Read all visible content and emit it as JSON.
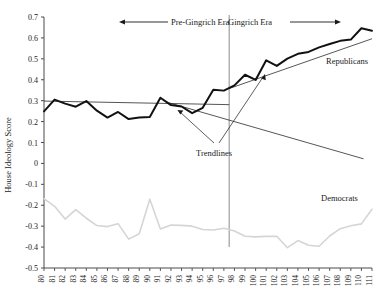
{
  "chart_data": {
    "type": "line",
    "title": "",
    "xlabel": "",
    "ylabel": "House Ideology Score",
    "xlim": [
      80,
      111
    ],
    "ylim": [
      -0.5,
      0.7
    ],
    "grid": false,
    "legend_position": "inline-labels",
    "categories": [
      80,
      81,
      82,
      83,
      84,
      85,
      86,
      87,
      88,
      89,
      90,
      91,
      92,
      93,
      94,
      95,
      96,
      97,
      98,
      99,
      100,
      101,
      102,
      103,
      104,
      105,
      106,
      107,
      108,
      109,
      110,
      111
    ],
    "xtick_labels": [
      "80",
      "81",
      "82",
      "83",
      "84",
      "85",
      "86",
      "87",
      "88",
      "89",
      "90",
      "91",
      "92",
      "93",
      "94",
      "95",
      "96",
      "97",
      "98",
      "99",
      "100",
      "101",
      "102",
      "103",
      "104",
      "105",
      "106",
      "107",
      "108",
      "109",
      "110",
      "111"
    ],
    "ytick_labels": [
      "0.7",
      "0.6",
      "0.5",
      "0.4",
      "0.3",
      "0.2",
      "0.1",
      "0",
      "-0.1",
      "-0.2",
      "-0.3",
      "-0.4",
      "-0.5"
    ],
    "ytick_values": [
      0.7,
      0.6,
      0.5,
      0.4,
      0.3,
      0.2,
      0.1,
      0,
      -0.1,
      -0.2,
      -0.3,
      -0.4,
      -0.5
    ],
    "series": [
      {
        "name": "Republicans",
        "color": "#111111",
        "values": [
          0.249,
          0.305,
          0.286,
          0.271,
          0.298,
          0.252,
          0.219,
          0.246,
          0.212,
          0.219,
          0.222,
          0.314,
          0.279,
          0.272,
          0.24,
          0.266,
          0.352,
          0.348,
          0.373,
          0.424,
          0.399,
          0.493,
          0.466,
          0.501,
          0.524,
          0.533,
          0.555,
          0.571,
          0.586,
          0.592,
          0.646,
          0.634
        ]
      },
      {
        "name": "Democrats",
        "color": "#d5d5d5",
        "values": [
          -0.168,
          -0.205,
          -0.266,
          -0.221,
          -0.262,
          -0.297,
          -0.302,
          -0.288,
          -0.362,
          -0.336,
          -0.171,
          -0.314,
          -0.295,
          -0.296,
          -0.3,
          -0.316,
          -0.318,
          -0.31,
          -0.323,
          -0.348,
          -0.351,
          -0.349,
          -0.348,
          -0.403,
          -0.369,
          -0.391,
          -0.396,
          -0.347,
          -0.312,
          -0.298,
          -0.289,
          -0.219
        ]
      }
    ],
    "annotations": {
      "era_divider": {
        "x": 97.5,
        "label": "era-divider",
        "color": "#8a8a8a"
      },
      "pre_era_label": "Pre-Gingrich Era",
      "post_era_label": "Gingrich Era",
      "trendlines_label": "Trendlines",
      "republicans_label": "Republicans",
      "democrats_label": "Democrats",
      "trendlines": [
        {
          "name": "pre-gingrich-trendline",
          "x0": 80,
          "y0": 0.298,
          "x1": 97.5,
          "y1": 0.281
        },
        {
          "name": "gingrich-trendline",
          "x0": 97.5,
          "y0": 0.358,
          "x1": 111,
          "y1": 0.596
        },
        {
          "name": "descending-guide",
          "x0": 91.6,
          "y0": 0.293,
          "x1": 110.2,
          "y1": 0.022
        }
      ]
    }
  }
}
